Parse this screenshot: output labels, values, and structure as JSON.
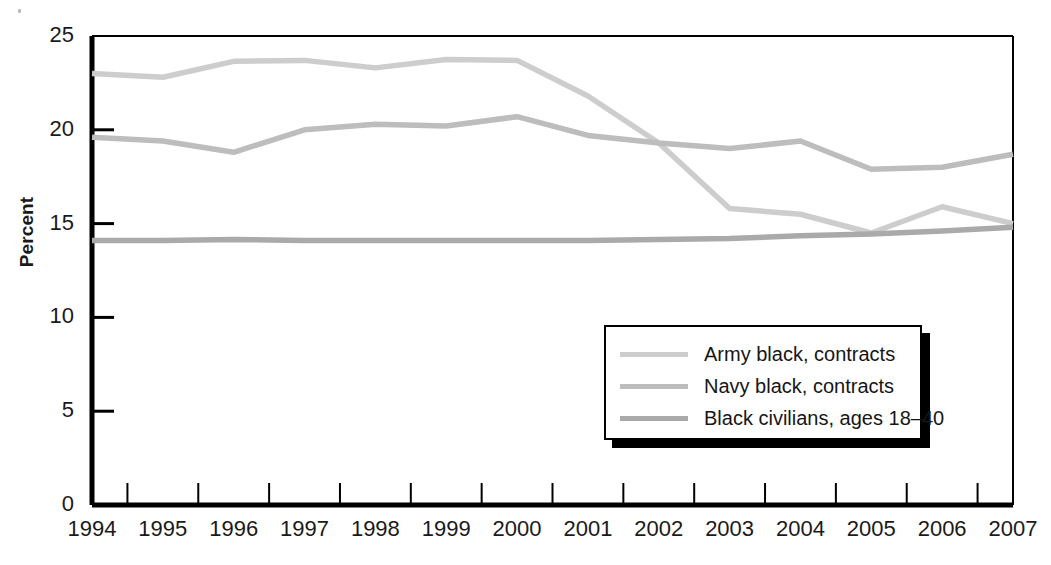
{
  "chart_data": {
    "type": "line",
    "title": "",
    "xlabel": "",
    "ylabel": "Percent",
    "x": [
      1994,
      1995,
      1996,
      1997,
      1998,
      1999,
      2000,
      2001,
      2002,
      2003,
      2004,
      2005,
      2006,
      2007
    ],
    "categories": [
      "1994",
      "1995",
      "1996",
      "1997",
      "1998",
      "1999",
      "2000",
      "2001",
      "2002",
      "2003",
      "2004",
      "2005",
      "2006",
      "2007"
    ],
    "xlim": [
      1994,
      2007
    ],
    "ylim": [
      0,
      25
    ],
    "yticks": [
      0,
      5,
      10,
      15,
      20,
      25
    ],
    "ytick_labels": [
      "0",
      "5",
      "10",
      "15",
      "20",
      "25"
    ],
    "grid": false,
    "legend_position": "lower-right",
    "series": [
      {
        "name": "Army black, contracts",
        "color": "#cdcdcd",
        "values": [
          23.0,
          22.8,
          23.65,
          23.7,
          23.3,
          23.75,
          23.7,
          21.8,
          19.3,
          15.8,
          15.5,
          14.5,
          15.9,
          15.0
        ]
      },
      {
        "name": "Navy black, contracts",
        "color": "#bdbdbd",
        "values": [
          19.6,
          19.4,
          18.8,
          20.0,
          20.3,
          20.2,
          20.7,
          19.7,
          19.3,
          19.0,
          19.4,
          17.9,
          18.0,
          18.7
        ]
      },
      {
        "name": "Black civilians, ages 18–40",
        "color": "#aaaaaa",
        "values": [
          14.1,
          14.1,
          14.15,
          14.1,
          14.1,
          14.1,
          14.1,
          14.1,
          14.15,
          14.2,
          14.35,
          14.45,
          14.6,
          14.8
        ]
      }
    ]
  },
  "axis": {
    "y_title": "Percent",
    "axis_color": "#000000"
  },
  "legend": {
    "items": [
      {
        "label": "Army black, contracts",
        "color": "#cdcdcd"
      },
      {
        "label": "Navy black, contracts",
        "color": "#bdbdbd"
      },
      {
        "label": "Black civilians, ages 18–40",
        "color": "#aaaaaa"
      }
    ]
  }
}
